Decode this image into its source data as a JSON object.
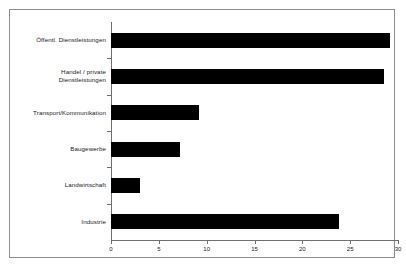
{
  "chart_data": {
    "type": "bar",
    "orientation": "horizontal",
    "title": "",
    "subtitle": "",
    "xlabel": "",
    "ylabel": "",
    "categories": [
      "Öffentl. Dienstleistungen",
      "Handel / private\nDienstleistungen",
      "Transport/Kommunikation",
      "Baugewerbe",
      "Landwirtschaft",
      "Industrie"
    ],
    "values": [
      29.2,
      28.5,
      9.2,
      7.2,
      3.0,
      23.8
    ],
    "xlim": [
      0,
      30
    ],
    "xticks": [
      0,
      5,
      10,
      15,
      20,
      25,
      30
    ],
    "xtick_labels": [
      "0",
      "5",
      "10",
      "15",
      "20",
      "25",
      "30"
    ],
    "grid": false,
    "legend": false,
    "bar_color": "#000000",
    "axis_color": "#6f6f6f",
    "frame_color": "#8d8d8d"
  }
}
